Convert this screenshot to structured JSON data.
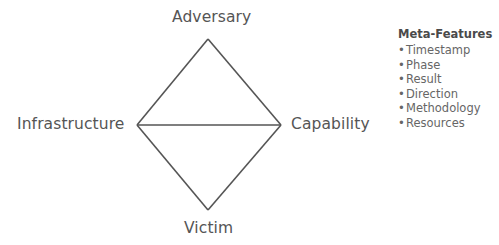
{
  "diagram": {
    "vertices": {
      "top": "Adversary",
      "left": "Infrastructure",
      "right": "Capability",
      "bottom": "Victim"
    },
    "edges": [
      [
        "Adversary",
        "Infrastructure"
      ],
      [
        "Adversary",
        "Capability"
      ],
      [
        "Infrastructure",
        "Capability"
      ],
      [
        "Infrastructure",
        "Victim"
      ],
      [
        "Capability",
        "Victim"
      ]
    ],
    "line_color": "#555555"
  },
  "meta_features": {
    "title": "Meta-Features",
    "bullet": "•",
    "items": [
      "Timestamp",
      "Phase",
      "Result",
      "Direction",
      "Methodology",
      "Resources"
    ]
  }
}
